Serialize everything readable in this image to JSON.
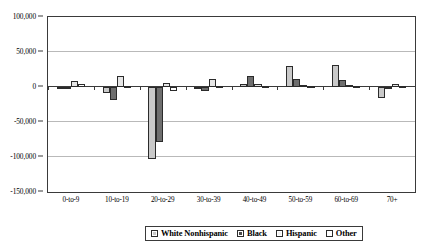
{
  "chart_data": {
    "type": "bar",
    "title": "",
    "xlabel": "",
    "ylabel": "",
    "ylim": [
      -150000,
      100000
    ],
    "ytick_values": [
      100000,
      50000,
      0,
      -50000,
      -100000,
      -150000
    ],
    "ytick_labels": [
      "100,000",
      "50,000",
      "0",
      "-50,000",
      "-100,000",
      "-150,000"
    ],
    "grid": true,
    "legend_position": "bottom",
    "categories": [
      "0-to-9",
      "10-to-19",
      "20-to-29",
      "30-to-39",
      "40-to-49",
      "50-to-59",
      "60-to-69",
      "70+"
    ],
    "series": [
      {
        "name": "White Nonhispanic",
        "color": "#c9c9c9",
        "values": [
          -2000,
          -9000,
          -103000,
          -1000,
          4000,
          30000,
          31000,
          -15000
        ]
      },
      {
        "name": "Black",
        "color": "#6e6e6e",
        "values": [
          -2000,
          -18000,
          -78000,
          -5000,
          16000,
          12000,
          10000,
          -1000
        ]
      },
      {
        "name": "Hispanic",
        "color": "#e6e6e6",
        "values": [
          8000,
          16000,
          6000,
          11000,
          5000,
          3000,
          3000,
          4000
        ]
      },
      {
        "name": "Other",
        "color": "#ffffff",
        "values": [
          4000,
          1000,
          -6000,
          1000,
          2000,
          2000,
          2000,
          1000
        ]
      }
    ]
  },
  "legend": {
    "items": [
      {
        "label": "White Nonhispanic"
      },
      {
        "label": "Black"
      },
      {
        "label": "Hispanic"
      },
      {
        "label": "Other"
      }
    ]
  }
}
